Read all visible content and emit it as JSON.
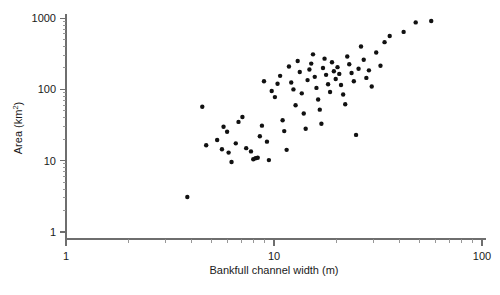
{
  "chart_data": {
    "type": "scatter",
    "title": "",
    "xlabel": "Bankfull channel width (m)",
    "ylabel": "Area (km²)",
    "ylabel_base": "Area (km",
    "ylabel_sup": "2",
    "ylabel_close": ")",
    "xscale": "log",
    "yscale": "log",
    "xlim": [
      1,
      100
    ],
    "ylim": [
      1,
      1000
    ],
    "grid": false,
    "legend": null,
    "xticks": [
      1,
      10,
      100
    ],
    "xtick_labels": [
      "1",
      "10",
      "100"
    ],
    "yticks": [
      1,
      10,
      100,
      1000
    ],
    "ytick_labels": [
      "1",
      "10",
      "100",
      "1000"
    ],
    "marker": "filled-circle",
    "marker_color": "#111111",
    "marker_size_px": 3.4,
    "n_points": 78,
    "x": [
      3.83,
      4.52,
      4.72,
      5.33,
      5.62,
      5.72,
      5.95,
      6.05,
      6.25,
      6.55,
      6.75,
      7.05,
      7.35,
      7.75,
      7.95,
      8.15,
      8.35,
      8.55,
      8.75,
      8.95,
      9.25,
      9.45,
      9.75,
      10.1,
      10.4,
      10.7,
      11.0,
      11.2,
      11.5,
      11.8,
      12.1,
      12.4,
      12.7,
      13.0,
      13.3,
      13.6,
      13.9,
      14.2,
      14.5,
      14.8,
      15.1,
      15.4,
      15.7,
      16.0,
      16.3,
      16.6,
      16.9,
      17.2,
      17.5,
      17.8,
      18.2,
      18.6,
      19.0,
      19.4,
      19.8,
      20.2,
      20.6,
      21.0,
      21.5,
      22.0,
      22.5,
      23.0,
      23.6,
      24.2,
      24.8,
      25.5,
      26.2,
      27.0,
      27.8,
      28.6,
      29.5,
      31.0,
      32.5,
      34.0,
      36.0,
      42.0,
      48.0,
      57.0
    ],
    "y": [
      3.1,
      57.0,
      16.5,
      19.5,
      14.5,
      30.0,
      25.5,
      13.0,
      9.6,
      17.5,
      35.0,
      41.0,
      15.0,
      13.5,
      10.5,
      10.8,
      11.0,
      22.0,
      31.0,
      130.0,
      18.5,
      10.2,
      95.0,
      78.0,
      120.0,
      155.0,
      37.0,
      26.0,
      14.2,
      210.0,
      125.0,
      100.0,
      60.0,
      250.0,
      175.0,
      88.0,
      46.0,
      28.0,
      135.0,
      190.0,
      230.0,
      310.0,
      150.0,
      105.0,
      72.0,
      52.0,
      33.0,
      200.0,
      270.0,
      160.0,
      118.0,
      92.0,
      240.0,
      180.0,
      140.0,
      205.0,
      165.0,
      115.0,
      85.0,
      62.0,
      290.0,
      225.0,
      170.0,
      130.0,
      23.0,
      195.0,
      400.0,
      260.0,
      145.0,
      185.0,
      110.0,
      330.0,
      215.0,
      460.0,
      560.0,
      640.0,
      870.0,
      910.0
    ]
  }
}
